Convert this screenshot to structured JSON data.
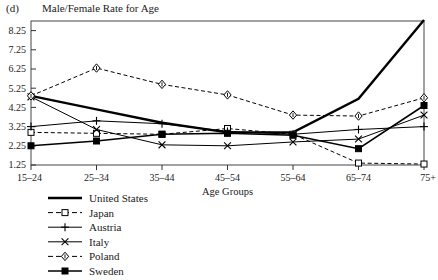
{
  "figure": {
    "panel_label": "(d)",
    "title": "Male/Female Rate for Age"
  },
  "chart_data": {
    "type": "line",
    "title": "Male/Female Rate for Age",
    "panel_label": "(d)",
    "xlabel": "Age Groups",
    "ylabel": "",
    "categories": [
      "15–24",
      "25–34",
      "35–44",
      "45–54",
      "55–64",
      "65–74",
      "75+"
    ],
    "yticks": [
      "1.25",
      "2.25",
      "3.25",
      "4.25",
      "5.25",
      "6.25",
      "7.25",
      "8.25"
    ],
    "ylim": [
      1.25,
      8.75
    ],
    "grid": false,
    "legend_position": "below-left",
    "series": [
      {
        "name": "United States",
        "style": "solid",
        "width": "thick",
        "marker": "none",
        "color": "#000000",
        "values": [
          4.85,
          4.15,
          3.45,
          2.95,
          2.95,
          4.7,
          8.8
        ]
      },
      {
        "name": "Japan",
        "style": "dashed",
        "width": "thin",
        "marker": "open-square",
        "color": "#000000",
        "values": [
          2.95,
          2.9,
          2.85,
          3.15,
          2.85,
          1.35,
          1.3
        ]
      },
      {
        "name": "Austria",
        "style": "solid",
        "width": "thin",
        "marker": "plus",
        "color": "#000000",
        "values": [
          3.25,
          3.55,
          3.4,
          3.0,
          2.85,
          3.1,
          3.25
        ]
      },
      {
        "name": "Italy",
        "style": "solid",
        "width": "thin",
        "marker": "cross",
        "color": "#000000",
        "values": [
          4.8,
          3.1,
          2.3,
          2.25,
          2.45,
          2.6,
          3.85
        ]
      },
      {
        "name": "Poland",
        "style": "dashed",
        "width": "thin",
        "marker": "open-diamond",
        "color": "#000000",
        "values": [
          4.85,
          6.3,
          5.45,
          4.9,
          3.85,
          3.8,
          4.75
        ]
      },
      {
        "name": "Sweden",
        "style": "solid",
        "width": "medium",
        "marker": "filled-square",
        "color": "#000000",
        "values": [
          2.25,
          2.5,
          2.85,
          2.9,
          2.8,
          2.1,
          4.35
        ]
      }
    ]
  },
  "legend": {
    "items": [
      {
        "label": "United States"
      },
      {
        "label": "Japan"
      },
      {
        "label": "Austria"
      },
      {
        "label": "Italy"
      },
      {
        "label": "Poland"
      },
      {
        "label": "Sweden"
      }
    ]
  }
}
